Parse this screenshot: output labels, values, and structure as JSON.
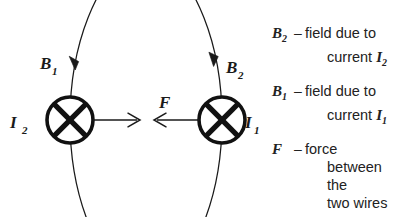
{
  "figure": {
    "background_color": "#ffffff",
    "line_color": "#1a1a1a",
    "wires": [
      {
        "id": "wire-left",
        "current_label": "I",
        "current_subscript": "2",
        "field_label": "B",
        "field_subscript": "1",
        "symbol": "current-into-page",
        "center_x": 70,
        "center_y": 120,
        "radius": 23,
        "force_direction": "right"
      },
      {
        "id": "wire-right",
        "current_label": "I",
        "current_subscript": "1",
        "field_label": "B",
        "field_subscript": "2",
        "symbol": "current-into-page",
        "center_x": 222,
        "center_y": 120,
        "radius": 23,
        "force_direction": "left"
      }
    ],
    "force_label": "F",
    "field_arc_radius": 152,
    "arrow_color": "#1a1a1a"
  },
  "legend": {
    "entries": [
      {
        "symbol": "B",
        "symbol_sub": "2",
        "dash": "–",
        "line1": "field due to",
        "line2_prefix": "current ",
        "line2_italic": "I",
        "line2_italic_sub": "2",
        "line2_suffix": ""
      },
      {
        "symbol": "B",
        "symbol_sub": "1",
        "dash": "–",
        "line1": "field due to",
        "line2_prefix": "current ",
        "line2_italic": "I",
        "line2_italic_sub": "1",
        "line2_suffix": ""
      },
      {
        "symbol": "F",
        "symbol_sub": "",
        "dash": "–",
        "line1": "force",
        "line2_prefix": "between the",
        "line2_italic": "",
        "line2_italic_sub": "",
        "line2_suffix": "",
        "line3": "two wires"
      }
    ]
  }
}
